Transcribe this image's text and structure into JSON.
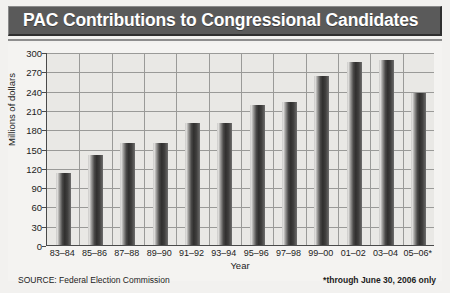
{
  "chart_data": {
    "type": "bar",
    "title": "PAC Contributions to Congressional Candidates",
    "xlabel": "Year",
    "ylabel": "Millions of dollars",
    "ylim": [
      0,
      300
    ],
    "ytick_step": 30,
    "yticks": [
      300,
      270,
      240,
      210,
      180,
      150,
      120,
      90,
      60,
      30,
      0
    ],
    "grid": true,
    "legend": "none",
    "categories": [
      "83–84",
      "85–86",
      "87–88",
      "89–90",
      "91–92",
      "93–94",
      "95–96",
      "97–98",
      "99–00",
      "01–02",
      "03–04",
      "05–06*"
    ],
    "values": [
      112,
      140,
      158,
      158,
      189,
      189,
      217,
      222,
      263,
      285,
      288,
      236
    ],
    "annotations": [
      "SOURCE: Federal Election Commission",
      "*through June 30, 2006 only"
    ]
  },
  "header": {
    "title": "PAC Contributions to Congressional Candidates"
  },
  "footer": {
    "source": "SOURCE: Federal Election Commission",
    "asterisk": "*through June 30, 2006 only"
  },
  "colors": {
    "title_bar": "#5a5a5a",
    "title_text": "#ffffff",
    "plot_background": "#e9e8e5",
    "page_background": "#f2f1ef",
    "gridline": "#9a9a98",
    "axis": "#4a4a4a",
    "bar_dark": "#302f2e",
    "bar_light": "#e6e5e3"
  }
}
